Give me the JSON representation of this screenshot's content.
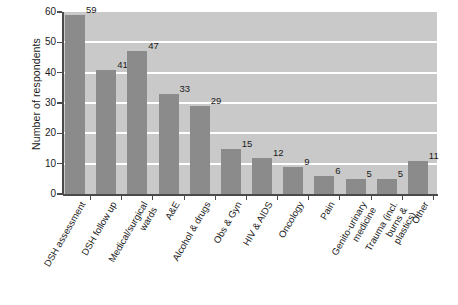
{
  "chart_data": {
    "type": "bar",
    "title": "",
    "xlabel": "",
    "ylabel": "Number of respondents",
    "ylim": [
      0,
      60
    ],
    "ytick_labels": [
      "60",
      "50",
      "40",
      "30",
      "20",
      "10",
      "0"
    ],
    "ytick_values": [
      60,
      50,
      40,
      30,
      20,
      10,
      0
    ],
    "grid": true,
    "legend": "none",
    "categories": [
      "DSH assessment",
      "DSH follow up",
      "Medical/surgical\nwards",
      "A&E",
      "Alcohol & drugs",
      "Obs & Gyn",
      "HIV & AIDS",
      "Oncology",
      "Pain",
      "Genito-urinary\nmedicine",
      "Trauma (incl.\nburns & plastics)",
      "Other"
    ],
    "values": [
      59,
      41,
      47,
      33,
      29,
      15,
      12,
      9,
      6,
      5,
      5,
      11
    ],
    "data_labels": [
      "59",
      "41",
      "47",
      "33",
      "29",
      "15",
      "12",
      "9",
      "6",
      "5",
      "5",
      "11"
    ],
    "colors": {
      "bar": "#8b8b8b",
      "plot_background": "#c9c9c9",
      "gridline": "#ffffff",
      "axis": "#4a4a4a",
      "text": "#1b1b1b",
      "page_background": "#ffffff"
    }
  }
}
